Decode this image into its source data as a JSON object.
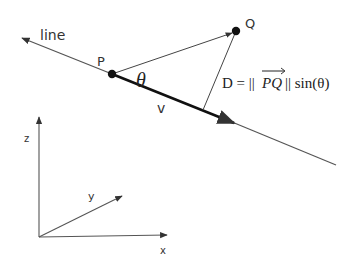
{
  "diagram": {
    "labels": {
      "line": "line",
      "p": "P",
      "q": "Q",
      "theta": "θ",
      "v": "v",
      "formula_prefix": "D = ||",
      "formula_vector": "PQ",
      "formula_suffix": "|| sin(θ)",
      "axis_x": "x",
      "axis_y": "y",
      "axis_z": "z"
    },
    "colors": {
      "stroke": "#444444",
      "point": "#111111",
      "background": "#ffffff"
    }
  }
}
